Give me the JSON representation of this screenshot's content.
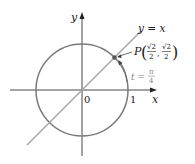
{
  "diagram": {
    "axis_x_label": "x",
    "axis_y_label": "y",
    "origin_label": "0",
    "tick_one_label": "1",
    "line_label": "y = x",
    "point_name": "P",
    "point_x_num": "√2",
    "point_x_den": "2",
    "point_y_num": "√2",
    "point_y_den": "2",
    "t_label": "t =",
    "t_num": "π",
    "t_den": "4",
    "colors": {
      "circle": "#7a7a7a",
      "line": "#a8a8a8",
      "axes": "#333333",
      "point": "#555555",
      "t_label": "#888888"
    }
  }
}
